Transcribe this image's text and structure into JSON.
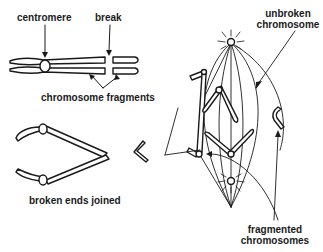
{
  "labels": {
    "centromere": "centromere",
    "break": "break",
    "chromosome_fragments": "chromosome fragments",
    "broken_ends_joined": "broken ends joined",
    "unbroken_chromosome_line1": "unbroken",
    "unbroken_chromosome_line2": "chromosome",
    "fragmented_chromosomes_line1": "fragmented",
    "fragmented_chromosomes_line2": "chromosomes"
  },
  "colors": {
    "ink": "#1a1a1a",
    "background": "#ffffff"
  }
}
